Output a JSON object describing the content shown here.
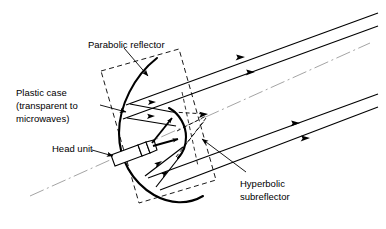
{
  "figure": {
    "colors": {
      "ink": "#000000",
      "axis_gray": "#999999",
      "background": "#ffffff"
    }
  },
  "labels": {
    "parabolic_reflector": "Parabolic reflector",
    "plastic_case_line1": "Plastic case",
    "plastic_case_line2": "(transparent to",
    "plastic_case_line3": "microwaves)",
    "head_unit": "Head unit",
    "hyperbolic_line1": "Hyperbolic",
    "hyperbolic_line2": "subreflector"
  },
  "parts": {
    "parabolic_reflector": "parabolic-reflector-curve",
    "hyperbolic_subreflector": "hyperbolic-subreflector-curve",
    "head_unit": "head-unit-waveguide",
    "plastic_case": "plastic-case-outline",
    "optical_axis": "optical-axis-centerline",
    "virtual_focus": "virtual-focus-point"
  },
  "rays": {
    "outgoing_beam_count": 4,
    "feed_ray_count": 6,
    "virtual_ray_count": 4,
    "outgoing_direction": "up-right",
    "arrowhead_style": "solid-triangle"
  }
}
